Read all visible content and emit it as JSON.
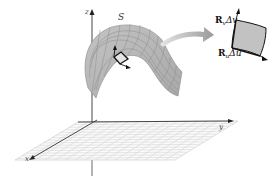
{
  "figure": {
    "surface_label": "S",
    "axes": {
      "x": "x",
      "y": "y",
      "z": "z"
    },
    "patch_labels": {
      "rv": {
        "bold": "R",
        "sub": "v",
        "delta": "Δv"
      },
      "ru": {
        "bold": "R",
        "sub": "u",
        "delta": "Δu"
      }
    },
    "colors": {
      "surface": "#b8b8b8",
      "surface_grid": "#8a8a8a",
      "patch_fill": "#c2c2c2",
      "patch_edge": "#111111",
      "plane_grid": "#c8c8c8",
      "axis": "#333333",
      "arrow": "#a8a8a8"
    }
  }
}
